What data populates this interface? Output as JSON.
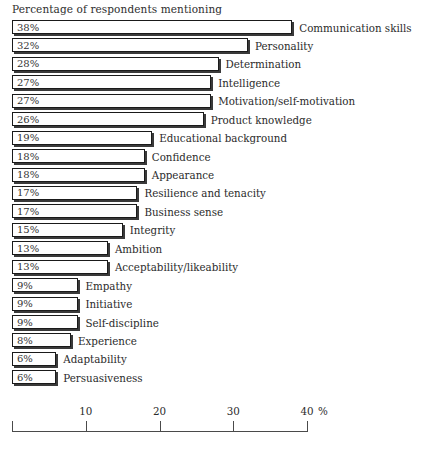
{
  "chart_data": {
    "type": "bar",
    "orientation": "horizontal",
    "title": "Percentage of respondents mentioning",
    "xlabel": "%",
    "ylabel": "",
    "xlim": [
      0,
      40
    ],
    "grid": false,
    "legend": null,
    "unit_symbol": "%",
    "xticks": [
      0,
      10,
      20,
      30,
      40
    ],
    "xtick_labels": [
      "",
      "10",
      "20",
      "30",
      "40"
    ],
    "categories": [
      "Communication skills",
      "Personality",
      "Determination",
      "Intelligence",
      "Motivation/self-motivation",
      "Product knowledge",
      "Educational background",
      "Confidence",
      "Appearance",
      "Resilience and tenacity",
      "Business sense",
      "Integrity",
      "Ambition",
      "Acceptability/likeability",
      "Empathy",
      "Initiative",
      "Self-discipline",
      "Experience",
      "Adaptability",
      "Persuasiveness"
    ],
    "values": [
      38,
      32,
      28,
      27,
      27,
      26,
      19,
      18,
      18,
      17,
      17,
      15,
      13,
      13,
      9,
      9,
      9,
      8,
      6,
      6
    ],
    "value_labels": [
      "38%",
      "32%",
      "28%",
      "27%",
      "27%",
      "26%",
      "19%",
      "18%",
      "18%",
      "17%",
      "17%",
      "15%",
      "13%",
      "13%",
      "9%",
      "9%",
      "9%",
      "8%",
      "6%",
      "6%"
    ],
    "bars": [
      {
        "label": "Communication skills",
        "value": 38,
        "value_label": "38%"
      },
      {
        "label": "Personality",
        "value": 32,
        "value_label": "32%"
      },
      {
        "label": "Determination",
        "value": 28,
        "value_label": "28%"
      },
      {
        "label": "Intelligence",
        "value": 27,
        "value_label": "27%"
      },
      {
        "label": "Motivation/self-motivation",
        "value": 27,
        "value_label": "27%"
      },
      {
        "label": "Product knowledge",
        "value": 26,
        "value_label": "26%"
      },
      {
        "label": "Educational background",
        "value": 19,
        "value_label": "19%"
      },
      {
        "label": "Confidence",
        "value": 18,
        "value_label": "18%"
      },
      {
        "label": "Appearance",
        "value": 18,
        "value_label": "18%"
      },
      {
        "label": "Resilience and tenacity",
        "value": 17,
        "value_label": "17%"
      },
      {
        "label": "Business sense",
        "value": 17,
        "value_label": "17%"
      },
      {
        "label": "Integrity",
        "value": 15,
        "value_label": "15%"
      },
      {
        "label": "Ambition",
        "value": 13,
        "value_label": "13%"
      },
      {
        "label": "Acceptability/likeability",
        "value": 13,
        "value_label": "13%"
      },
      {
        "label": "Empathy",
        "value": 9,
        "value_label": "9%"
      },
      {
        "label": "Initiative",
        "value": 9,
        "value_label": "9%"
      },
      {
        "label": "Self-discipline",
        "value": 9,
        "value_label": "9%"
      },
      {
        "label": "Experience",
        "value": 8,
        "value_label": "8%"
      },
      {
        "label": "Adaptability",
        "value": 6,
        "value_label": "6%"
      },
      {
        "label": "Persuasiveness",
        "value": 6,
        "value_label": "6%"
      }
    ],
    "colors": {
      "bar_fill": "#ffffff",
      "bar_border": "#1a1a1a",
      "bar_shadow": "#3a3a3a",
      "text": "#2b2b2b",
      "axis": "#4a4a4a",
      "background": "#ffffff"
    }
  }
}
